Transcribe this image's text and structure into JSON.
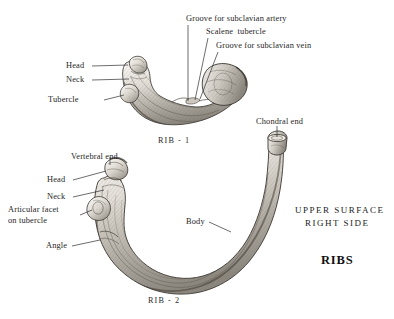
{
  "plate": {
    "width": 394,
    "height": 319,
    "background": "#ffffff",
    "ink": "#2b2b2b",
    "bone_light": "#f2f0ec",
    "bone_mid": "#b9b5ad",
    "bone_dark": "#6f6a62",
    "outline": "#3a3630"
  },
  "title": "RIBS",
  "orientation": {
    "line1": "UPPER SURFACE",
    "line2": "RIGHT SIDE"
  },
  "figures": [
    {
      "id": "rib-1",
      "caption": "RIB - 1",
      "labels": [
        {
          "name": "head",
          "text": "Head",
          "align": "right"
        },
        {
          "name": "neck",
          "text": "Neck",
          "align": "right"
        },
        {
          "name": "tubercle",
          "text": "Tubercle",
          "align": "right"
        },
        {
          "name": "groove-subclavian-artery",
          "text": "Groove for subclavian artery",
          "align": "left"
        },
        {
          "name": "scalene-tubercle",
          "text": "Scalene  tubercle",
          "align": "left"
        },
        {
          "name": "groove-subclavian-vein",
          "text": "Groove for subclavian vein",
          "align": "left"
        }
      ]
    },
    {
      "id": "rib-2",
      "caption": "RIB - 2",
      "labels": [
        {
          "name": "vertebral-end",
          "text": "Vertebral end",
          "align": "center"
        },
        {
          "name": "head",
          "text": "Head",
          "align": "right"
        },
        {
          "name": "neck",
          "text": "Neck",
          "align": "right"
        },
        {
          "name": "articular-facet",
          "text": "Articular facet\non tubercle",
          "align": "right"
        },
        {
          "name": "angle",
          "text": "Angle",
          "align": "right"
        },
        {
          "name": "body",
          "text": "Body",
          "align": "right"
        },
        {
          "name": "chondral-end",
          "text": "Chondral end",
          "align": "center"
        }
      ]
    }
  ]
}
